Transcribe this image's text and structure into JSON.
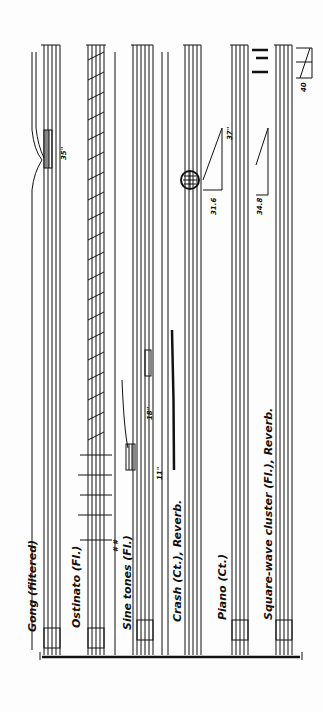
{
  "score": {
    "orientation": "rotated-90-ccw",
    "instruments": [
      {
        "id": "gong",
        "label": "Gong (filtered)"
      },
      {
        "id": "ostinato",
        "label": "Ostinato (Fl.)"
      },
      {
        "id": "sine",
        "label": "Sine tones (Fl.)",
        "symbol": "∿"
      },
      {
        "id": "crash",
        "label": "Crash (Ct.), Reverb."
      },
      {
        "id": "piano",
        "label": "Piano (Ct.)"
      },
      {
        "id": "square",
        "label": "Square-wave cluster (Fl.), Reverb.",
        "symbol": "⎍"
      }
    ],
    "markings": {
      "gong_time": "35\"",
      "sine_time": "11\"",
      "crash_time": "18\"",
      "crash_swell_time": "37\"",
      "crash_decay_time": "31.6",
      "square_time": "34.8",
      "end_time": "40",
      "ostinato_dyn": "# #"
    }
  }
}
